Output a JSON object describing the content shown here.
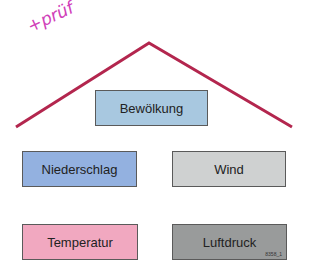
{
  "annotation": {
    "text": "+prüf",
    "color": "#d040b8"
  },
  "roof": {
    "color": "#b3264e"
  },
  "boxes": {
    "cloud": {
      "label": "Bewölkung",
      "color": "#a8c8e0"
    },
    "precip": {
      "label": "Niederschlag",
      "color": "#93b1e0"
    },
    "wind": {
      "label": "Wind",
      "color": "#cfd1d1"
    },
    "temp": {
      "label": "Temperatur",
      "color": "#f1a8c0"
    },
    "pressure": {
      "label": "Luftdruck",
      "color": "#999b9b"
    }
  },
  "figure_code": "8358_1"
}
